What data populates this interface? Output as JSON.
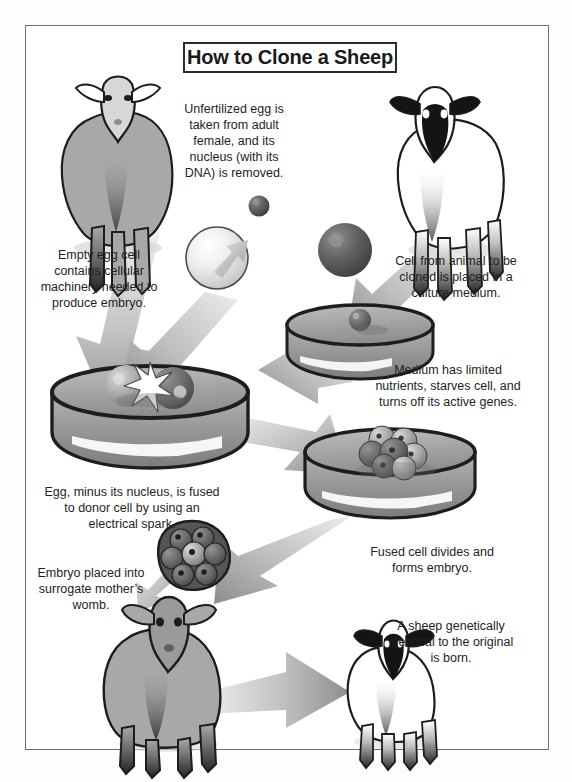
{
  "figure": {
    "title": "How to Clone a Sheep",
    "type": "instructional-diagram"
  },
  "captions": [
    {
      "id": "egg-extraction",
      "text": "Unfertilized egg is taken from adult female, and its nucleus (with its DNA) is removed."
    },
    {
      "id": "empty-egg",
      "text": "Empty egg cell contains cellular machinery needed to produce embryo."
    },
    {
      "id": "donor-cell",
      "text": "Cell from animal to be cloned is placed in a culture medium."
    },
    {
      "id": "starvation",
      "text": "Medium has limited nutrients, starves cell, and turns off its active genes."
    },
    {
      "id": "fusion",
      "text": "Egg, minus its nucleus, is fused to donor cell by using an electrical spark."
    },
    {
      "id": "division",
      "text": "Fused cell divides and forms embryo."
    },
    {
      "id": "implant",
      "text": "Embryo placed into surrogate mother’s womb."
    },
    {
      "id": "birth",
      "text": "A sheep genetically identical to the original is born."
    }
  ],
  "objects": [
    {
      "id": "ewe-donor-egg",
      "label": "adult female sheep"
    },
    {
      "id": "sheep-to-clone",
      "label": "animal to be cloned"
    },
    {
      "id": "egg-cell",
      "label": "unfertilized egg cell"
    },
    {
      "id": "removed-nucleus",
      "label": "removed nucleus"
    },
    {
      "id": "donor-cell-sphere",
      "label": "donor body cell"
    },
    {
      "id": "dish-culture",
      "label": "petri dish with donor cell"
    },
    {
      "id": "dish-fusion",
      "label": "petri dish with fusing cells and spark"
    },
    {
      "id": "dish-embryo",
      "label": "petri dish with dividing embryo"
    },
    {
      "id": "embryo-morula",
      "label": "embryo"
    },
    {
      "id": "surrogate-mother",
      "label": "surrogate mother sheep"
    },
    {
      "id": "cloned-lamb",
      "label": "cloned sheep"
    }
  ],
  "colors": {
    "frame": "#6f6f6f",
    "title_border": "#2c2c2c",
    "text": "#231f20",
    "sheep_body": "#a8a8a8",
    "sheep_dark": "#2a2a2a",
    "dish_medium": "#8f8f8f",
    "dish_rim": "#1d1d1d",
    "arrow": "#9a9a9a",
    "cell_light": "#e8e8e8",
    "cell_dark": "#5a5a5a",
    "background": "#ffffff"
  }
}
